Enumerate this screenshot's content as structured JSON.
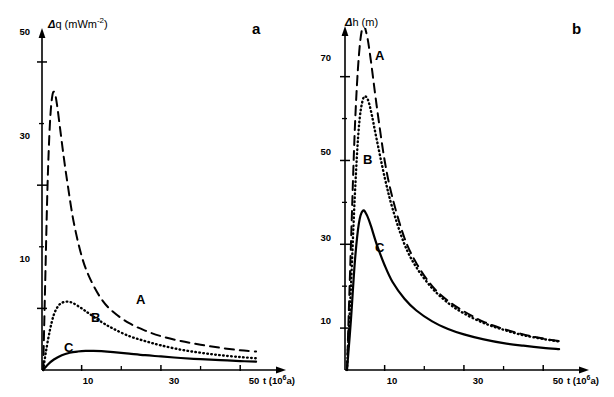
{
  "figure": {
    "panels": [
      {
        "letter": "a",
        "y_axis_title": "q  (mWm",
        "y_axis_title_sup": "-2",
        "y_axis_title_close": ")",
        "y_axis_symbol": "Δ",
        "x_axis_title": "t (10",
        "x_axis_title_sup": "6",
        "x_axis_title_close": "a)",
        "y_ticks_major": [
          "50",
          "30",
          "10"
        ],
        "x_ticks_major": [
          "10",
          "30",
          "50"
        ],
        "curve_labels": [
          "A",
          "B",
          "C"
        ]
      },
      {
        "letter": "b",
        "y_axis_title": "h (m)",
        "y_axis_title_sup": "",
        "y_axis_title_close": "",
        "y_axis_symbol": "Δ",
        "x_axis_title": "t (10",
        "x_axis_title_sup": "6",
        "x_axis_title_close": "a)",
        "y_ticks_major": [
          "70",
          "50",
          "30",
          "10"
        ],
        "x_ticks_major": [
          "10",
          "30",
          "50"
        ],
        "curve_labels": [
          "A",
          "B",
          "C"
        ]
      }
    ]
  },
  "chart_data": [
    {
      "type": "line",
      "title": "",
      "panel": "a",
      "xlabel": "t (10^6 a)",
      "ylabel": "Δq (mWm^-2)",
      "xlim": [
        0,
        56
      ],
      "ylim": [
        0,
        56
      ],
      "xticks": [
        10,
        30,
        50
      ],
      "yticks": [
        10,
        30,
        50
      ],
      "minor_yticks": [
        20,
        40
      ],
      "minor_xticks": [
        20,
        40
      ],
      "grid": false,
      "legend": "inline-curve-labels",
      "series": [
        {
          "name": "A",
          "style": "dashed",
          "x": [
            0.3,
            0.8,
            1.4,
            2.0,
            2.6,
            3.2,
            3.8,
            4.6,
            5.5,
            6.5,
            8.0,
            10.0,
            12.0,
            15.0,
            18.0,
            22.0,
            26.0,
            30.0,
            35.0,
            40.0,
            45.0,
            50.0,
            54.0
          ],
          "y": [
            0.0,
            14.0,
            30.0,
            40.0,
            44.5,
            45.0,
            43.0,
            39.0,
            34.5,
            30.0,
            24.0,
            18.5,
            15.0,
            11.5,
            9.4,
            7.6,
            6.4,
            5.5,
            4.7,
            4.1,
            3.6,
            3.2,
            3.0
          ]
        },
        {
          "name": "B",
          "style": "dotted",
          "x": [
            0.3,
            1.0,
            2.0,
            3.0,
            4.0,
            5.0,
            6.5,
            8.0,
            10.0,
            12.0,
            15.0,
            18.0,
            22.0,
            26.0,
            30.0,
            35.0,
            40.0,
            45.0,
            50.0,
            54.0
          ],
          "y": [
            0.0,
            3.0,
            6.5,
            9.0,
            10.3,
            10.9,
            11.1,
            10.8,
            10.0,
            9.1,
            7.8,
            6.7,
            5.5,
            4.7,
            4.0,
            3.3,
            2.8,
            2.4,
            2.1,
            1.9
          ]
        },
        {
          "name": "C",
          "style": "solid",
          "x": [
            0.3,
            1.5,
            3.0,
            5.0,
            7.0,
            9.0,
            11.0,
            13.0,
            15.0,
            18.0,
            22.0,
            26.0,
            30.0,
            35.0,
            40.0,
            45.0,
            50.0,
            54.0
          ],
          "y": [
            0.0,
            0.9,
            1.7,
            2.4,
            2.8,
            3.0,
            3.1,
            3.1,
            3.05,
            2.9,
            2.65,
            2.4,
            2.2,
            1.95,
            1.75,
            1.6,
            1.45,
            1.35
          ]
        }
      ]
    },
    {
      "type": "line",
      "title": "",
      "panel": "b",
      "xlabel": "t (10^6 a)",
      "ylabel": "Δh (m)",
      "xlim": [
        0,
        56
      ],
      "ylim": [
        0,
        82
      ],
      "xticks": [
        10,
        30,
        50
      ],
      "yticks": [
        10,
        30,
        50,
        70
      ],
      "minor_yticks": [
        20,
        40,
        60,
        80
      ],
      "minor_xticks": [
        20,
        40
      ],
      "grid": false,
      "legend": "inline-curve-labels",
      "series": [
        {
          "name": "A",
          "style": "dashed",
          "x": [
            0.5,
            1.5,
            2.5,
            3.5,
            4.5,
            5.5,
            6.5,
            8.0,
            10.0,
            12.0,
            15.0,
            18.0,
            22.0,
            26.0,
            30.0,
            35.0,
            40.0,
            45.0,
            50.0,
            54.0
          ],
          "y": [
            0.0,
            30.0,
            58.0,
            75.0,
            82.0,
            80.0,
            74.0,
            63.0,
            50.0,
            41.0,
            31.5,
            25.5,
            20.0,
            16.5,
            14.0,
            11.5,
            9.8,
            8.5,
            7.5,
            6.9
          ]
        },
        {
          "name": "B",
          "style": "dotted",
          "x": [
            0.5,
            1.5,
            2.5,
            3.5,
            4.5,
            5.5,
            6.5,
            8.0,
            10.0,
            12.0,
            15.0,
            18.0,
            22.0,
            26.0,
            30.0,
            35.0,
            40.0,
            45.0,
            50.0,
            54.0
          ],
          "y": [
            0.0,
            20.0,
            42.0,
            58.0,
            64.5,
            65.0,
            62.0,
            55.0,
            46.0,
            38.5,
            30.0,
            24.5,
            19.5,
            16.0,
            13.5,
            11.2,
            9.6,
            8.3,
            7.4,
            6.8
          ]
        },
        {
          "name": "C",
          "style": "solid",
          "x": [
            0.5,
            1.5,
            2.5,
            3.5,
            4.5,
            5.5,
            6.5,
            8.0,
            10.0,
            12.0,
            15.0,
            18.0,
            22.0,
            26.0,
            30.0,
            35.0,
            40.0,
            45.0,
            50.0,
            54.0
          ],
          "y": [
            0.0,
            12.0,
            26.0,
            35.0,
            38.0,
            37.0,
            34.5,
            30.0,
            25.0,
            21.0,
            17.0,
            14.2,
            11.6,
            9.8,
            8.5,
            7.3,
            6.4,
            5.8,
            5.3,
            5.0
          ]
        }
      ]
    }
  ]
}
